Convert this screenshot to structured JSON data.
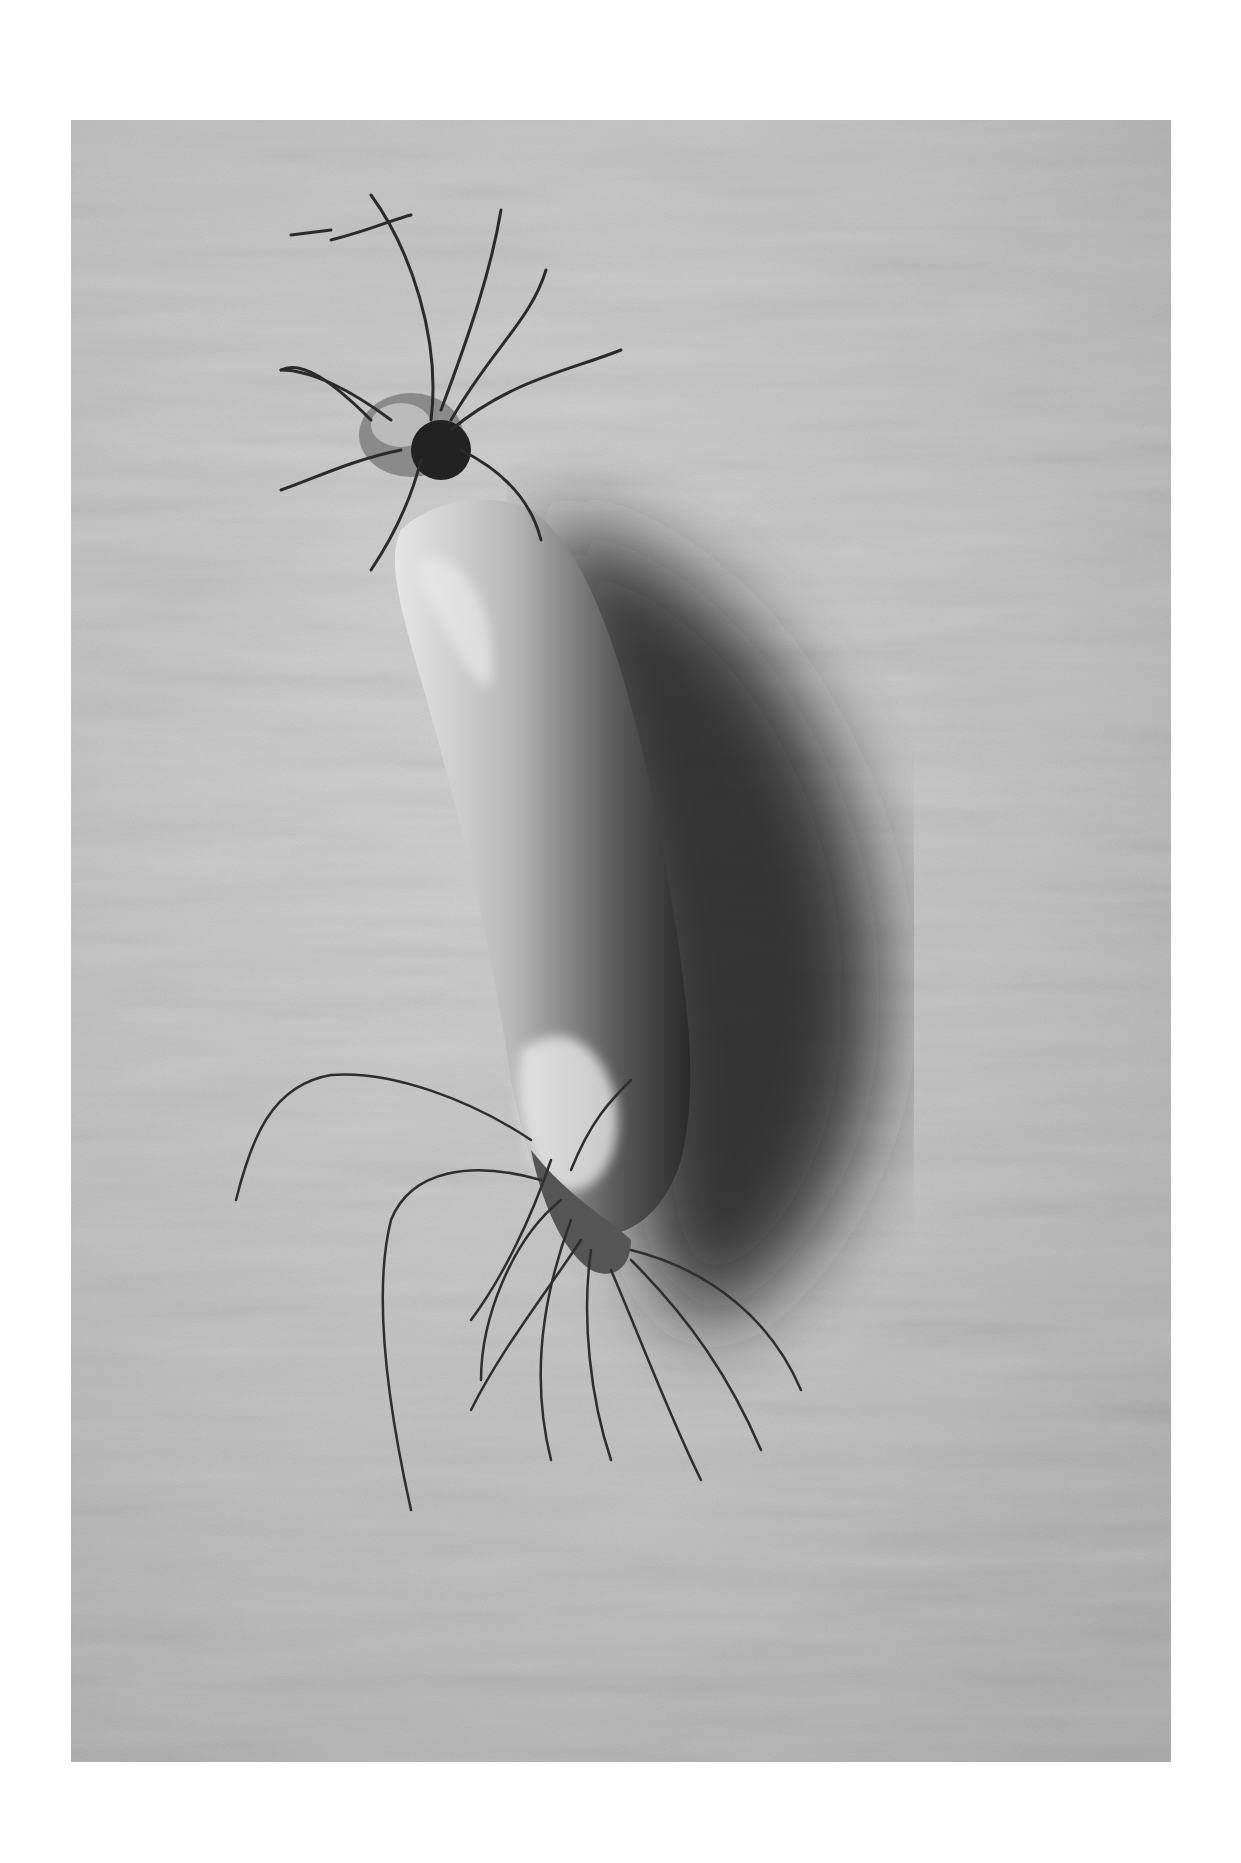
{
  "image": {
    "alt": "Black-and-white photograph of a single daikon radish with hairy roots lying diagonally on a textured plaster surface, casting a dark shadow to the right",
    "subject": "daikon radish",
    "style": "monochrome photograph",
    "border_color": "#ffffff",
    "background_tone": "#bdbdbd",
    "shadow_tone": "#2a2a2a",
    "radish_tone": "#d8d8d8"
  }
}
